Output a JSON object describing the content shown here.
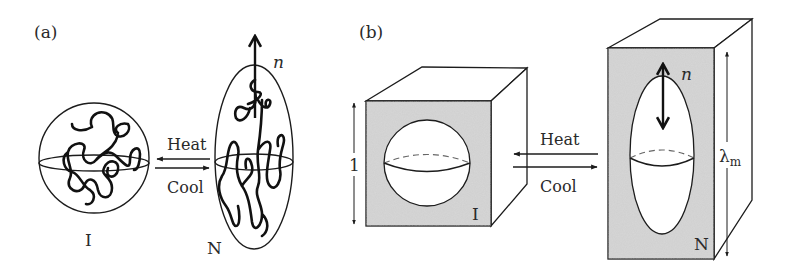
{
  "figure": {
    "panels": [
      {
        "id": "a",
        "label": "(a)",
        "left_state": {
          "label": "I",
          "shape": "sphere-with-coiled-chain"
        },
        "right_state": {
          "label": "N",
          "shape": "prolate-ellipsoid-with-coiled-chain",
          "director_label": "n"
        },
        "forward_process": "Heat",
        "reverse_process": "Cool"
      },
      {
        "id": "b",
        "label": "(b)",
        "left_state": {
          "label": "I",
          "shape": "cube-with-spherical-cavity",
          "dimension_label": "1"
        },
        "right_state": {
          "label": "N",
          "shape": "elongated-box-with-ellipsoidal-cavity",
          "director_label": "n",
          "dimension_label": "λ",
          "dimension_subscript": "m"
        },
        "forward_process": "Heat",
        "reverse_process": "Cool"
      }
    ],
    "colors": {
      "line": "#1c1c1c",
      "fill_gray": "#cfcfcf",
      "background": "#ffffff",
      "text": "#2a2a2a"
    }
  }
}
